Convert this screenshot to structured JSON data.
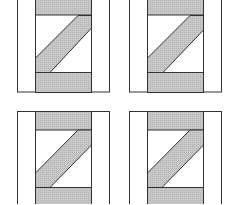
{
  "diagram": {
    "colors": {
      "fill": "#c4c4c4",
      "stroke": "#333333",
      "background": "#ffffff"
    },
    "blocks": [
      {
        "id": "top-left",
        "outer": [
          17,
          0,
          110,
          92
        ],
        "inner": [
          35,
          91
        ],
        "bands": [
          15,
          72
        ]
      },
      {
        "id": "top-right",
        "outer": [
          129,
          0,
          222,
          92
        ],
        "inner": [
          147,
          203
        ],
        "bands": [
          15,
          72
        ]
      },
      {
        "id": "bottom-left",
        "outer": [
          17,
          111,
          110,
          204
        ],
        "inner": [
          35,
          91
        ],
        "bands": [
          130,
          187
        ]
      },
      {
        "id": "bottom-right",
        "outer": [
          129,
          111,
          222,
          204
        ],
        "inner": [
          147,
          203
        ],
        "bands": [
          130,
          187
        ]
      }
    ]
  }
}
